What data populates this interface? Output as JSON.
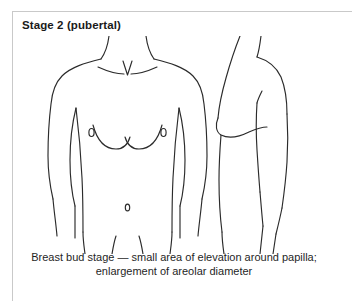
{
  "card": {
    "title": "Stage 2 (pubertal)",
    "border_color": "#c9c9c9",
    "background_color": "#ffffff"
  },
  "figure": {
    "line_color": "#2b2b2b",
    "views": [
      {
        "name": "anterior-torso-view",
        "label": "Frontal view of female torso, Tanner stage 2",
        "features": [
          "neck",
          "sternal-notch",
          "clavicles",
          "shoulders",
          "arms",
          "breast-bud-left",
          "breast-bud-right",
          "nipple-left",
          "nipple-right",
          "navel",
          "hips",
          "thighs"
        ]
      },
      {
        "name": "lateral-profile-view",
        "label": "Side profile view of female torso, Tanner stage 2",
        "features": [
          "neck",
          "shoulder",
          "breast-bud-elevation",
          "arm",
          "abdomen",
          "buttock",
          "thigh"
        ]
      }
    ]
  },
  "caption": {
    "line1": "Breast bud stage — small area of elevation around papilla;",
    "line2": "enlargement of areolar diameter"
  }
}
